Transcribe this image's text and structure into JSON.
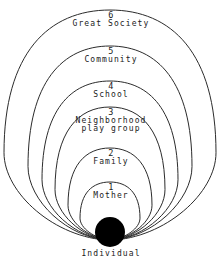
{
  "diagram": {
    "type": "concentric-arcs",
    "focus": {
      "label": "Individual",
      "shape": "filled-circle",
      "color": "#000000",
      "center_x": 110,
      "center_y": 232,
      "radius": 15
    },
    "stroke_color": "#2b2b2b",
    "background": "#ffffff",
    "rings": [
      {
        "number": "1",
        "name": "Mother",
        "name_line2": "",
        "num_y": 188,
        "name_y": 198,
        "half_width": 30,
        "top_y": 182
      },
      {
        "number": "2",
        "name": "Family",
        "name_line2": "",
        "num_y": 154,
        "name_y": 164,
        "half_width": 42,
        "top_y": 148
      },
      {
        "number": "3",
        "name": "Neighborhood",
        "name_line2": "play group",
        "num_y": 113,
        "name_y": 123,
        "half_width": 55,
        "top_y": 107
      },
      {
        "number": "4",
        "name": "School",
        "name_line2": "",
        "num_y": 87,
        "name_y": 97,
        "half_width": 68,
        "top_y": 81
      },
      {
        "number": "5",
        "name": "Community",
        "name_line2": "",
        "num_y": 52,
        "name_y": 62,
        "half_width": 82,
        "top_y": 46
      },
      {
        "number": "6",
        "name": "Great Society",
        "name_line2": "",
        "num_y": 16,
        "name_y": 26,
        "half_width": 106,
        "top_y": 10
      }
    ]
  }
}
